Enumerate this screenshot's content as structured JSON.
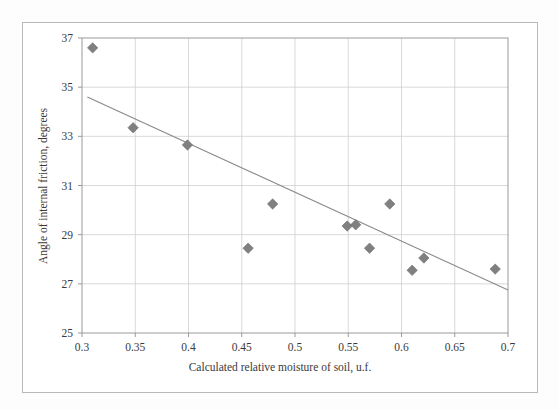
{
  "chart_data": {
    "type": "scatter",
    "title": "",
    "xlabel": "Calculated relative moisture of soil, u.f.",
    "ylabel": "Angle of internal friction, degrees",
    "xlim": [
      0.3,
      0.7
    ],
    "ylim": [
      25,
      37
    ],
    "xticks": [
      "0.3",
      "0.35",
      "0.4",
      "0.45",
      "0.5",
      "0.55",
      "0.6",
      "0.65",
      "0.7"
    ],
    "xtick_values": [
      0.3,
      0.35,
      0.4,
      0.45,
      0.5,
      0.55,
      0.6,
      0.65,
      0.7
    ],
    "yticks": [
      "25",
      "27",
      "29",
      "31",
      "33",
      "35",
      "37"
    ],
    "ytick_values": [
      25,
      27,
      29,
      31,
      33,
      35,
      37
    ],
    "grid": true,
    "legend": "none",
    "marker": "diamond",
    "marker_color": "#808080",
    "trendline_color": "#8a8a8a",
    "grid_color": "#cfcfcf",
    "axis_color": "#9a9a9a",
    "x": [
      0.31,
      0.348,
      0.399,
      0.456,
      0.479,
      0.549,
      0.557,
      0.57,
      0.589,
      0.61,
      0.621,
      0.688
    ],
    "y": [
      36.6,
      33.35,
      32.65,
      28.45,
      30.25,
      29.35,
      29.4,
      28.45,
      30.25,
      27.55,
      28.05,
      27.6
    ],
    "points": [
      {
        "x": 0.31,
        "y": 36.6
      },
      {
        "x": 0.348,
        "y": 33.35
      },
      {
        "x": 0.399,
        "y": 32.65
      },
      {
        "x": 0.456,
        "y": 28.45
      },
      {
        "x": 0.479,
        "y": 30.25
      },
      {
        "x": 0.549,
        "y": 29.35
      },
      {
        "x": 0.557,
        "y": 29.4
      },
      {
        "x": 0.57,
        "y": 28.45
      },
      {
        "x": 0.589,
        "y": 30.25
      },
      {
        "x": 0.61,
        "y": 27.55
      },
      {
        "x": 0.621,
        "y": 28.05
      },
      {
        "x": 0.688,
        "y": 27.6
      }
    ],
    "series": [
      {
        "name": "Angle of internal friction",
        "values": [
          36.6,
          33.35,
          32.65,
          28.45,
          30.25,
          29.35,
          29.4,
          28.45,
          30.25,
          27.55,
          28.05,
          27.6
        ]
      }
    ],
    "trendline": {
      "type": "linear",
      "x_start": 0.305,
      "y_start": 34.6,
      "x_end": 0.7,
      "y_end": 26.75
    }
  }
}
